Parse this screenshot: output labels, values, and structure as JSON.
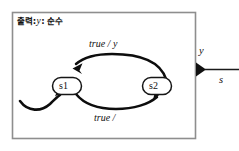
{
  "figure": {
    "kind": "finite-state-machine-diagram",
    "canvas_width": 239,
    "canvas_height": 151,
    "background_color": "#ffffff"
  },
  "actor": {
    "border_color": "#8e8e8e",
    "fill_color": "#ffffff",
    "header": {
      "prefix": "출력:",
      "variable": "y",
      "suffix": ": 순수"
    }
  },
  "states": [
    {
      "id": "s1",
      "label": "s1"
    },
    {
      "id": "s2",
      "label": "s2"
    }
  ],
  "transitions": [
    {
      "from": "s2",
      "to": "s1",
      "position": "top",
      "guard": "true",
      "separator": "/",
      "action": "y",
      "label": "true / y"
    },
    {
      "from": "s1",
      "to": "s2",
      "position": "bottom",
      "guard": "true",
      "separator": "/",
      "action": "",
      "label": "true /"
    }
  ],
  "initial_transition": {
    "to": "s1",
    "label": ""
  },
  "output_port": {
    "name": "y",
    "signal_label": "s",
    "marker": "filled-triangle"
  }
}
